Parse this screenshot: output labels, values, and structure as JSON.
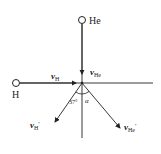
{
  "diagram": {
    "particles": [
      {
        "id": "he",
        "label": "He"
      },
      {
        "id": "h",
        "label": "H"
      }
    ],
    "vectors": {
      "v_h": {
        "symbol": "v",
        "sub": "H",
        "prime": ""
      },
      "v_he": {
        "symbol": "v",
        "sub": "He",
        "prime": ""
      },
      "v_h_prime": {
        "symbol": "v",
        "sub": "H",
        "prime": "′"
      },
      "v_he_prime": {
        "symbol": "v",
        "sub": "He",
        "prime": "′"
      }
    },
    "angles": {
      "theta_h": "37°",
      "alpha": "α"
    },
    "colors": {
      "stroke": "#222222",
      "background": "#ffffff"
    }
  }
}
